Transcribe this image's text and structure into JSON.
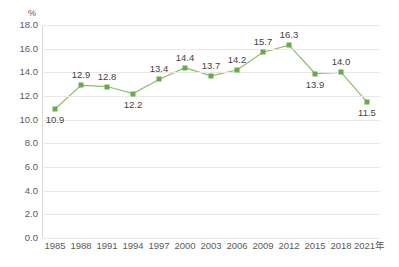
{
  "chart_data": {
    "type": "line",
    "title": "",
    "xlabel": "年",
    "ylabel": "%",
    "unit_label": "%",
    "x_axis_suffix": "年",
    "categories": [
      "1985",
      "1988",
      "1991",
      "1994",
      "1997",
      "2000",
      "2003",
      "2006",
      "2009",
      "2012",
      "2015",
      "2018",
      "2021"
    ],
    "values": [
      10.9,
      12.9,
      12.8,
      12.2,
      13.4,
      14.4,
      13.7,
      14.2,
      15.7,
      16.3,
      13.9,
      14.0,
      11.5
    ],
    "data_labels": [
      "10.9",
      "12.9",
      "12.8",
      "12.2",
      "13.4",
      "14.4",
      "13.7",
      "14.2",
      "15.7",
      "16.3",
      "13.9",
      "14.0",
      "11.5"
    ],
    "label_positions": [
      "below",
      "above",
      "above",
      "below",
      "above",
      "above",
      "above",
      "above",
      "above",
      "above",
      "below",
      "above",
      "below"
    ],
    "ylim": [
      0.0,
      18.0
    ],
    "y_ticks": [
      "0.0",
      "2.0",
      "4.0",
      "6.0",
      "8.0",
      "10.0",
      "12.0",
      "14.0",
      "16.0",
      "18.0"
    ],
    "y_tick_values": [
      0.0,
      2.0,
      4.0,
      6.0,
      8.0,
      10.0,
      12.0,
      14.0,
      16.0,
      18.0
    ],
    "grid": true,
    "legend": "none",
    "series_color": "#6aa84f",
    "line_color": "#8fbc6e",
    "grid_color": "#e8e8e8",
    "axis_color": "#d9d9d9",
    "text_color": "#5a5a5a"
  }
}
